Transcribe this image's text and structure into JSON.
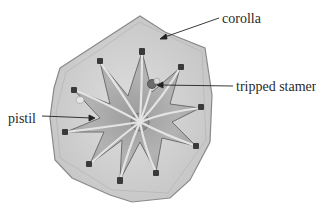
{
  "diagram": {
    "labels": {
      "corolla": "corolla",
      "tripped_stamen": "tripped stamen",
      "pistil": "pistil"
    },
    "colors": {
      "corolla_fill": "#c9c9c9",
      "corolla_edge": "#8a8a8a",
      "star_fill": "#a9a9a9",
      "star_edge": "#6e6e6e",
      "anther": "#3a3a3a",
      "leader_line": "#222222",
      "text": "#2a2a2a"
    },
    "stamen_count": 10
  }
}
